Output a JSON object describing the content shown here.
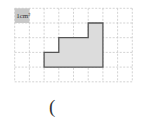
{
  "diagram": {
    "grid": {
      "origin_x": 14.7,
      "origin_y": 8.3,
      "cell_size": 14.7,
      "columns": 8,
      "rows": 5,
      "line_color": "#c8c8c8",
      "style": "dashed"
    },
    "unit_label": {
      "text": "1cm²",
      "cell_col": 0,
      "cell_row": 0,
      "fill": "#c9c9c9"
    },
    "shape": {
      "points_grid": [
        [
          2,
          4
        ],
        [
          2,
          3
        ],
        [
          3,
          3
        ],
        [
          3,
          2
        ],
        [
          5,
          2
        ],
        [
          5,
          1
        ],
        [
          6,
          1
        ],
        [
          6,
          4
        ]
      ],
      "fill": "#dcdcdc",
      "stroke": "#555555"
    },
    "answer_bracket": "("
  }
}
